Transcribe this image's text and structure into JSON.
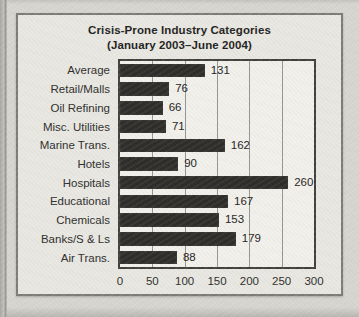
{
  "chart_data": {
    "type": "bar",
    "orientation": "horizontal",
    "title": "Crisis-Prone Industry Categories",
    "subtitle": "(January 2003–June 2004)",
    "categories": [
      "Average",
      "Retail/Malls",
      "Oil Refining",
      "Misc. Utilities",
      "Marine Trans.",
      "Hotels",
      "Hospitals",
      "Educational",
      "Chemicals",
      "Banks/S & Ls",
      "Air Trans."
    ],
    "values": [
      131,
      76,
      66,
      71,
      162,
      90,
      260,
      167,
      153,
      179,
      88
    ],
    "xlabel": "",
    "ylabel": "",
    "xlim": [
      0,
      300
    ],
    "xticks": [
      0,
      50,
      100,
      150,
      200,
      250,
      300
    ],
    "grid": "vertical-gridlines-on",
    "legend": "none",
    "value_labels": "shown-right-of-bars",
    "bar_color": "#2d2c29",
    "plot_background": "#f1f0eb",
    "panel_background": "#e8e7e2",
    "page_background": "#d6d5d0"
  }
}
